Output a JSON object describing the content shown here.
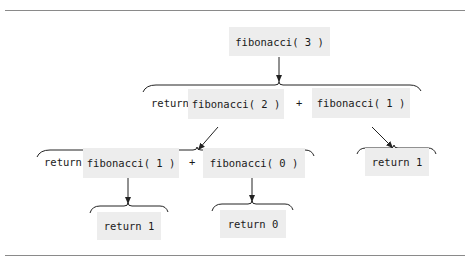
{
  "diagram": {
    "root": {
      "label": "fibonacci( 3 )"
    },
    "level1": {
      "return_keyword": "return",
      "left": "fibonacci( 2 )",
      "operator": "+",
      "right": "fibonacci( 1 )"
    },
    "level2": {
      "return_keyword": "return",
      "left": "fibonacci( 1 )",
      "operator": "+",
      "right": "fibonacci( 0 )",
      "right_result": "return 1"
    },
    "level3": {
      "left_result": "return 1",
      "right_result": "return 0"
    },
    "colors": {
      "box_fill": "#ededed",
      "line": "#222222",
      "rule": "#8a8a8a"
    }
  }
}
